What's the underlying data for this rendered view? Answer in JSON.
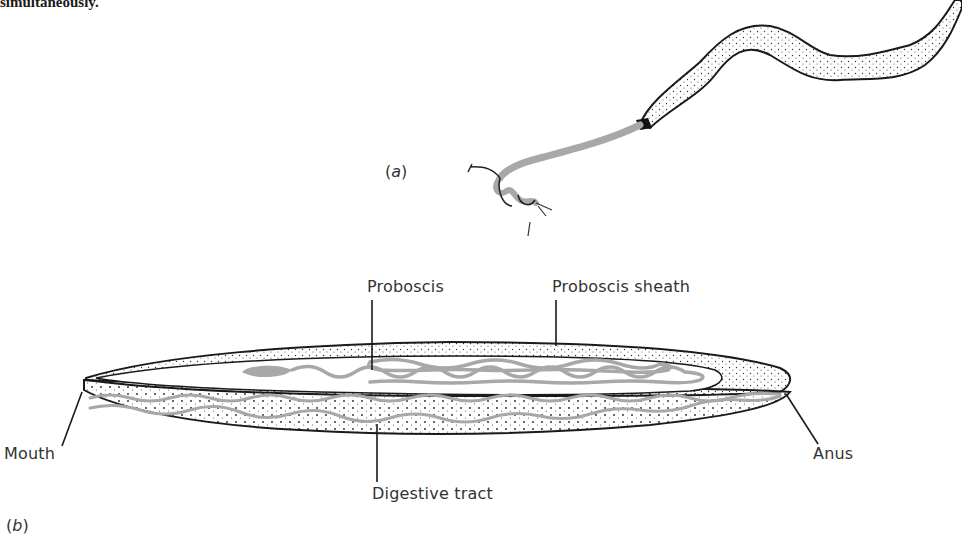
{
  "caption_fragment": "simultaneously.",
  "panels": {
    "a": {
      "label_open": "(",
      "label_letter": "a",
      "label_close": ")"
    },
    "b": {
      "label_open": "(",
      "label_letter": "b",
      "label_close": ")"
    }
  },
  "labels": {
    "proboscis": "Proboscis",
    "proboscis_sheath": "Proboscis sheath",
    "mouth": "Mouth",
    "anus": "Anus",
    "digestive_tract": "Digestive tract"
  },
  "colors": {
    "outline": "#1a1a1a",
    "proboscis_gray": "#a8a8a8",
    "stipple": "#333333",
    "background": "#ffffff"
  }
}
